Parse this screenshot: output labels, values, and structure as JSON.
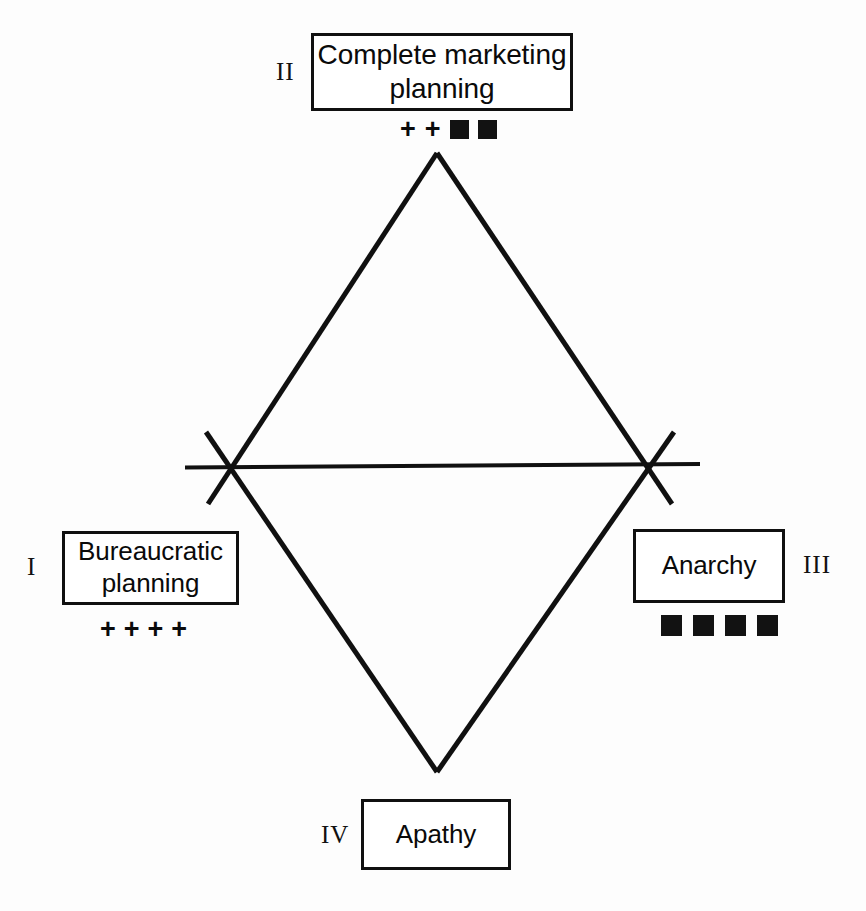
{
  "figure": {
    "type": "quadrant-diamond-diagram",
    "background_color": "#fdfdfd",
    "line_color": "#101010"
  },
  "nodes": {
    "top": {
      "numeral": "II",
      "label": "Complete marketing planning",
      "label_line1": "Complete marketing",
      "label_line2": "planning"
    },
    "left": {
      "numeral": "I",
      "label": "Bureaucratic planning",
      "label_line1": "Bureaucratic",
      "label_line2": "planning"
    },
    "right": {
      "numeral": "III",
      "label": "Anarchy"
    },
    "bottom": {
      "numeral": "IV",
      "label": "Apathy"
    }
  },
  "symbols": {
    "glyph_plus": "+",
    "top_row": [
      "plus",
      "plus",
      "square",
      "square"
    ],
    "left_row": [
      "plus",
      "plus",
      "plus",
      "plus"
    ],
    "right_row": [
      "square",
      "square",
      "square",
      "square"
    ],
    "bottom_row": [],
    "top_row_text": "+ + ■ ■",
    "left_row_text": "+ + + +",
    "right_row_text": "■ ■ ■ ■",
    "square_color": "#121212"
  },
  "geometry": {
    "diamond": {
      "top_apex": [
        437,
        153
      ],
      "bottom_apex": [
        437,
        772
      ],
      "left_vertex": [
        232,
        468
      ],
      "right_vertex": [
        648,
        468
      ],
      "overshoot_px": 36,
      "stroke_width": 5
    },
    "axis_line": {
      "x_start": 185,
      "y_start": 467,
      "x_end": 700,
      "y_end": 464,
      "stroke_width": 4
    }
  }
}
